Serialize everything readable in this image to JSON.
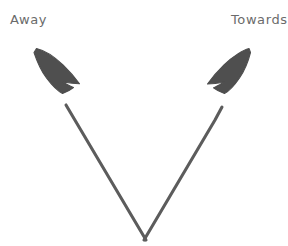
{
  "diagram": {
    "background_color": "#ffffff",
    "stroke_color": "#5c5c5c",
    "arrowhead_fill": "#4f4f4f",
    "label_color": "#6b6b6b",
    "style": "hand-drawn sketch",
    "labels": {
      "left": "Away",
      "right": "Towards"
    },
    "arrows": [
      {
        "name": "away-arrow",
        "direction": "up-left",
        "label": "Away",
        "tail": [
          146,
          240
        ],
        "head": [
          34,
          53
        ],
        "stroke_width": 3
      },
      {
        "name": "towards-arrow",
        "direction": "up-right",
        "label": "Towards",
        "tail": [
          144,
          240
        ],
        "head": [
          250,
          53
        ],
        "stroke_width": 3
      }
    ],
    "vertex": [
      145,
      240
    ]
  }
}
